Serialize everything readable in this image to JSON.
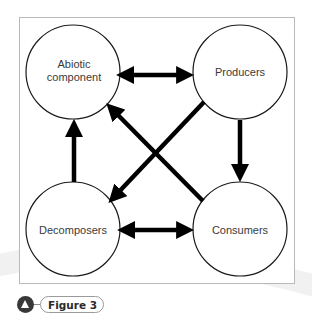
{
  "figure": {
    "caption_label": "Figure 3",
    "caption_icon": "triangle-in-circle-icon"
  },
  "diagram": {
    "type": "cycle-relationship",
    "nodes": [
      {
        "id": "abiotic",
        "label": "Abiotic\ncomponent",
        "position": "top-left"
      },
      {
        "id": "producers",
        "label": "Producers",
        "position": "top-right"
      },
      {
        "id": "decomposers",
        "label": "Decomposers",
        "position": "bottom-left"
      },
      {
        "id": "consumers",
        "label": "Consumers",
        "position": "bottom-right"
      }
    ],
    "edges": [
      {
        "from": "abiotic",
        "to": "producers",
        "direction": "both"
      },
      {
        "from": "producers",
        "to": "consumers",
        "direction": "forward"
      },
      {
        "from": "decomposers",
        "to": "consumers",
        "direction": "both"
      },
      {
        "from": "decomposers",
        "to": "abiotic",
        "direction": "forward"
      },
      {
        "from": "consumers",
        "to": "abiotic",
        "direction": "forward"
      },
      {
        "from": "producers",
        "to": "decomposers",
        "direction": "forward"
      }
    ]
  },
  "colors": {
    "arrow": "#000000",
    "node_stroke": "#1a1a1a",
    "box_border": "#b9b9b9",
    "label_text": "#3a3a3a",
    "caption_icon_bg": "#383838"
  }
}
